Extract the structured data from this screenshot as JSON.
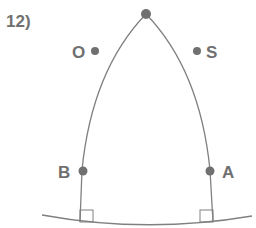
{
  "problem_number": "12)",
  "colors": {
    "stroke": "#808080",
    "point": "#707070",
    "text": "#707070"
  },
  "points": {
    "O": {
      "label": "O"
    },
    "S": {
      "label": "S"
    },
    "B": {
      "label": "B"
    },
    "A": {
      "label": "A"
    }
  }
}
